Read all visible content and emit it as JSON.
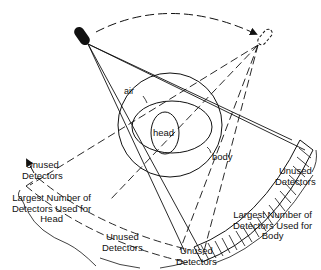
{
  "diagram": {
    "labels": {
      "air": "air",
      "head": "head",
      "body": "body",
      "unused_left_top": [
        "Unused",
        "Detectors"
      ],
      "largest_head": [
        "Largest Number of",
        "Detectors Used for",
        "Head"
      ],
      "unused_left_bottom": [
        "Unused",
        "Detectors"
      ],
      "unused_right_top": [
        "Unused",
        "Detectors"
      ],
      "largest_body": [
        "Largest Number of",
        "Detectors Used for",
        "Body"
      ],
      "unused_bottom_center": [
        "Unused",
        "Detectors"
      ]
    },
    "elements": {
      "source": "x-ray-source-solid",
      "source_rotated": "x-ray-source-dashed",
      "rotation_arrow": "dashed-arc-arrow",
      "detector_arc_body": "hatched-detector-arc",
      "detector_arc_head": "dashed-detector-arc"
    },
    "colors": {
      "ink": "#111111",
      "background": "#ffffff"
    }
  }
}
